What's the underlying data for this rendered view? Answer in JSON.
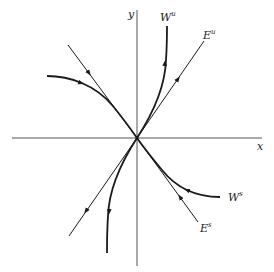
{
  "diagram": {
    "type": "phase-portrait",
    "axes": {
      "x_label": "x",
      "y_label": "y"
    },
    "curves": [
      {
        "id": "unstable-eigenspace",
        "label_base": "E",
        "label_sup": "u",
        "kind": "line",
        "arrow_direction": "outward"
      },
      {
        "id": "stable-eigenspace",
        "label_base": "E",
        "label_sup": "s",
        "kind": "line",
        "arrow_direction": "inward"
      },
      {
        "id": "unstable-manifold",
        "label_base": "W",
        "label_sup": "u",
        "kind": "curve",
        "arrow_direction": "outward"
      },
      {
        "id": "stable-manifold",
        "label_base": "W",
        "label_sup": "s",
        "kind": "curve",
        "arrow_direction": "inward"
      }
    ],
    "colors": {
      "ink": "#1a1a1a",
      "axis": "#555555",
      "background": "#ffffff"
    }
  }
}
